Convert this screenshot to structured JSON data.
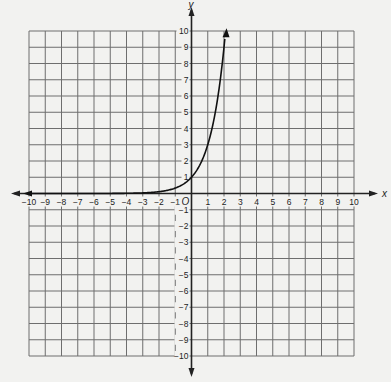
{
  "chart_data": {
    "type": "line",
    "title": "",
    "xlabel": "x",
    "ylabel": "y",
    "xlim": [
      -10,
      10
    ],
    "ylim": [
      -10,
      10
    ],
    "grid": true,
    "origin_label": "O",
    "x_ticks": [
      -10,
      -9,
      -8,
      -7,
      -6,
      -5,
      -4,
      -3,
      -2,
      -1,
      1,
      2,
      3,
      4,
      5,
      6,
      7,
      8,
      9,
      10
    ],
    "y_ticks": [
      10,
      9,
      8,
      7,
      6,
      5,
      4,
      3,
      2,
      1,
      -1,
      -2,
      -3,
      -4,
      -5,
      -6,
      -7,
      -8,
      -9,
      -10
    ],
    "series": [
      {
        "name": "exponential curve",
        "function": "y = 3^x",
        "x": [
          -10,
          -5,
          -4,
          -3,
          -2,
          -1,
          0,
          0.5,
          1,
          1.5,
          2,
          2.1
        ],
        "y": [
          2e-05,
          0.004,
          0.012,
          0.037,
          0.11,
          0.33,
          1,
          1.73,
          3,
          5.2,
          9,
          10
        ],
        "arrow_left": true,
        "arrow_right": true
      }
    ]
  },
  "colors": {
    "background": "#f2f2f0",
    "grid": "#6e6e6e",
    "axis": "#222222",
    "curve": "#111111"
  }
}
